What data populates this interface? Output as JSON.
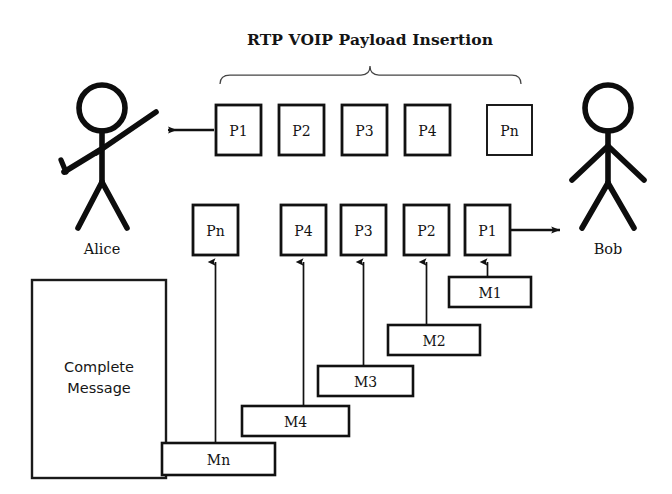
{
  "diagram": {
    "title": "RTP VOIP Payload Insertion",
    "actors": {
      "left": {
        "name": "Alice",
        "icon": "stick-figure-waving-icon"
      },
      "right": {
        "name": "Bob",
        "icon": "stick-figure-icon"
      }
    },
    "complete_message": {
      "line1": "Complete",
      "line2": "Message"
    },
    "top_row": {
      "caption": "RTP VOIP Payload Insertion",
      "direction": "left",
      "arrow_icon": "arrow-left-icon",
      "packets": [
        {
          "label": "P1"
        },
        {
          "label": "P2"
        },
        {
          "label": "P3"
        },
        {
          "label": "P4"
        },
        {
          "label": "Pn"
        }
      ]
    },
    "bottom_row": {
      "direction": "right",
      "arrow_icon": "arrow-right-icon",
      "packets": [
        {
          "label": "Pn"
        },
        {
          "label": "P4"
        },
        {
          "label": "P3"
        },
        {
          "label": "P2"
        },
        {
          "label": "P1"
        }
      ]
    },
    "message_fragments": [
      {
        "label": "M1",
        "feeds_packet": "P1"
      },
      {
        "label": "M2",
        "feeds_packet": "P2"
      },
      {
        "label": "M3",
        "feeds_packet": "P3"
      },
      {
        "label": "M4",
        "feeds_packet": "P4"
      },
      {
        "label": "Mn",
        "feeds_packet": "Pn"
      }
    ],
    "colors": {
      "ink": "#111111",
      "background": "#ffffff",
      "brace": "#444444"
    }
  }
}
